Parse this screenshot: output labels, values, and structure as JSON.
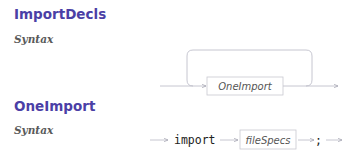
{
  "sections": [
    {
      "title": "ImportDecls",
      "subtitle": "Syntax",
      "diagram": {
        "type": "loop",
        "nonterminal": "OneImport"
      }
    },
    {
      "title": "OneImport",
      "subtitle": "Syntax",
      "diagram": {
        "type": "sequence",
        "keyword": "import",
        "nonterminal": "fileSpecs",
        "terminal": ";"
      }
    }
  ],
  "colors": {
    "heading": "#4b3fa6",
    "subheading": "#5a5a5a",
    "line": "#b8b8c4",
    "box_border": "#c8c8d0"
  }
}
